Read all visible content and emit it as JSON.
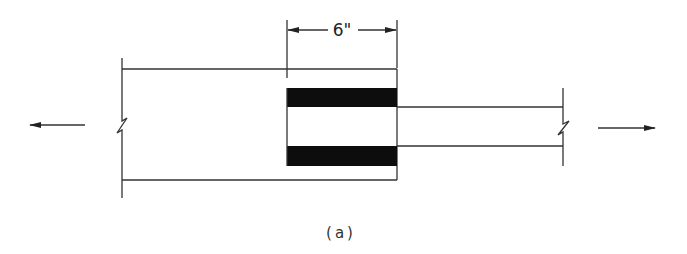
{
  "figure": {
    "dimension_label": "6\"",
    "caption": "(a)",
    "colors": {
      "line": "#333333",
      "fill": "#0d0d0d",
      "background": "#ffffff"
    },
    "elements": {
      "left_force_arrow": "arrow-left",
      "right_force_arrow": "arrow-right",
      "left_break": "break-line",
      "right_break": "break-line",
      "weld_blocks": 2
    }
  }
}
